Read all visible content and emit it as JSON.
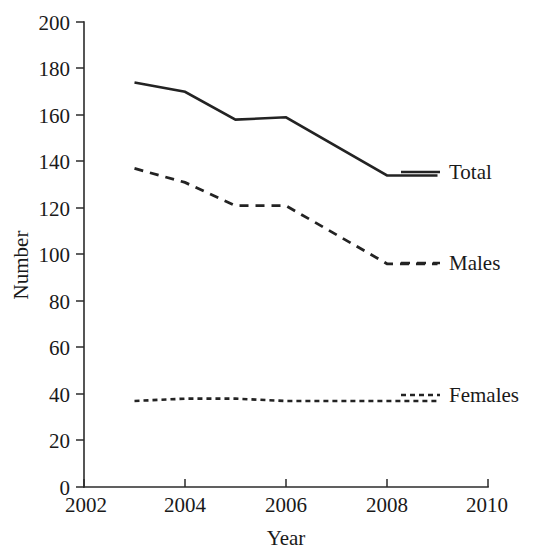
{
  "chart_data": {
    "type": "line",
    "title": "",
    "xlabel": "Year",
    "ylabel": "Number",
    "xlim": [
      2002,
      2010
    ],
    "ylim": [
      0,
      200
    ],
    "xticks": [
      2002,
      2004,
      2006,
      2008,
      2010
    ],
    "yticks": [
      0,
      20,
      40,
      60,
      80,
      100,
      120,
      140,
      160,
      180,
      200
    ],
    "grid": false,
    "legend_position": "line-end-labels",
    "x": [
      2003,
      2004,
      2005,
      2006,
      2008,
      2009
    ],
    "series": [
      {
        "name": "Total",
        "style": "solid",
        "color": "#232323",
        "values": [
          174,
          170,
          158,
          159,
          134,
          134
        ]
      },
      {
        "name": "Males",
        "style": "dashed",
        "color": "#232323",
        "values": [
          137,
          131,
          121,
          121,
          96,
          96
        ]
      },
      {
        "name": "Females",
        "style": "dotted",
        "color": "#232323",
        "values": [
          37,
          38,
          38,
          37,
          37,
          37
        ]
      }
    ]
  },
  "axes": {
    "y_title": "Number",
    "x_title": "Year",
    "y_tick_labels": [
      "0",
      "20",
      "40",
      "60",
      "80",
      "100",
      "120",
      "140",
      "160",
      "180",
      "200"
    ],
    "x_tick_labels": [
      "2002",
      "2004",
      "2006",
      "2008",
      "2010"
    ]
  },
  "legend": {
    "total_label": "Total",
    "males_label": "Males",
    "females_label": "Females"
  }
}
